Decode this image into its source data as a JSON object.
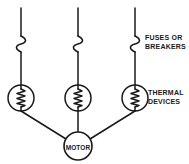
{
  "diagram": {
    "canvas": {
      "width": 189,
      "height": 164,
      "background": "#ffffff"
    },
    "stroke_color": "#1a1a1a",
    "labels": {
      "fuses_line1": "FUSES OR",
      "fuses_line2": "BREAKERS",
      "thermal_line1": "THERMAL",
      "thermal_line2": "DEVICES",
      "motor": "MOTOR"
    },
    "phases": [
      {
        "name": "phase-left",
        "line_x": 21,
        "supply_top_y": 8,
        "fuse_symbol": "s-curve",
        "fuse_y_top": 36,
        "fuse_y_bottom": 52,
        "thermal_device_cx": 21,
        "thermal_device_cy": 98,
        "thermal_device_r": 13
      },
      {
        "name": "phase-center",
        "line_x": 78,
        "supply_top_y": 8,
        "fuse_symbol": "s-curve",
        "fuse_y_top": 36,
        "fuse_y_bottom": 52,
        "thermal_device_cx": 78,
        "thermal_device_cy": 98,
        "thermal_device_r": 13
      },
      {
        "name": "phase-right",
        "line_x": 135,
        "supply_top_y": 8,
        "fuse_symbol": "s-curve",
        "fuse_y_top": 36,
        "fuse_y_bottom": 52,
        "thermal_device_cx": 135,
        "thermal_device_cy": 98,
        "thermal_device_r": 13
      }
    ],
    "motor": {
      "cx": 78,
      "cy": 146,
      "r": 14
    }
  }
}
